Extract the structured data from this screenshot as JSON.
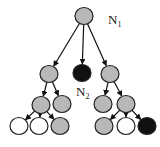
{
  "diagram": {
    "type": "tree",
    "colors": {
      "gray": "#b8b8b8",
      "black": "#111111",
      "white": "#ffffff",
      "stroke": "#222222"
    },
    "labels": {
      "n1": {
        "main": "N",
        "sub": "1"
      },
      "n2": {
        "main": "N",
        "sub": "2"
      }
    },
    "nodes": [
      {
        "id": "root",
        "x": 84,
        "y": 16,
        "fill": "gray"
      },
      {
        "id": "a",
        "x": 49,
        "y": 74,
        "fill": "gray"
      },
      {
        "id": "b",
        "x": 82,
        "y": 73,
        "fill": "black"
      },
      {
        "id": "c",
        "x": 110,
        "y": 74,
        "fill": "gray"
      },
      {
        "id": "d",
        "x": 41,
        "y": 105,
        "fill": "gray"
      },
      {
        "id": "e",
        "x": 62,
        "y": 104,
        "fill": "gray"
      },
      {
        "id": "f",
        "x": 103,
        "y": 104,
        "fill": "gray"
      },
      {
        "id": "g",
        "x": 126,
        "y": 104,
        "fill": "gray"
      },
      {
        "id": "h",
        "x": 19,
        "y": 126,
        "fill": "white"
      },
      {
        "id": "i",
        "x": 39,
        "y": 126,
        "fill": "white"
      },
      {
        "id": "j",
        "x": 60,
        "y": 126,
        "fill": "gray"
      },
      {
        "id": "k",
        "x": 104,
        "y": 126,
        "fill": "gray"
      },
      {
        "id": "l",
        "x": 126,
        "y": 126,
        "fill": "white"
      },
      {
        "id": "m",
        "x": 147,
        "y": 126,
        "fill": "black"
      }
    ],
    "edges": [
      [
        "root",
        "a"
      ],
      [
        "root",
        "b"
      ],
      [
        "root",
        "c"
      ],
      [
        "a",
        "d"
      ],
      [
        "a",
        "e"
      ],
      [
        "c",
        "f"
      ],
      [
        "c",
        "g"
      ],
      [
        "d",
        "h"
      ],
      [
        "d",
        "i"
      ],
      [
        "d",
        "j"
      ],
      [
        "g",
        "k"
      ],
      [
        "g",
        "l"
      ],
      [
        "g",
        "m"
      ]
    ]
  }
}
